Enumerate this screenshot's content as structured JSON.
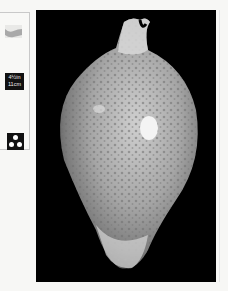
{
  "sidebar": {
    "habitat_icon": "wave-icon",
    "size": {
      "inches": "4½in",
      "cm": "11cm"
    },
    "group_icon": "three-dots-icon"
  },
  "photo": {
    "subject": "cowrie shell",
    "background_color": "#000000"
  },
  "colors": {
    "page": "#f7f7f5",
    "badge": "#111111",
    "wave": "#a9a9a9"
  }
}
